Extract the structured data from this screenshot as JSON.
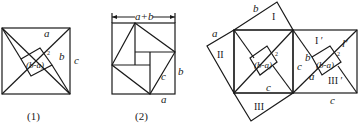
{
  "figure1": {
    "caption": "(1)",
    "labels": {
      "a": "a",
      "b": "b",
      "c": "c",
      "inner": "(b-a)",
      "inner_exp": "2"
    }
  },
  "figure2": {
    "caption": "(2)",
    "labels": {
      "top": "a+b",
      "b": "b",
      "c": "c",
      "a": "a"
    }
  },
  "figure3": {
    "labels": {
      "a_left": "a",
      "b_top": "b",
      "region_I": "I",
      "region_II": "II",
      "region_III": "III",
      "inner_left": "(b-a)",
      "inner_left_exp": "2",
      "c_bottom_center": "c",
      "c_mid": "c",
      "region_I_prime": "I ′",
      "l_prime": "l′",
      "region_III_prime": "III ′",
      "b_right": "b",
      "a_right": "a",
      "inner_right": "(b-a)",
      "inner_right_exp": "2",
      "c_bottom_right": "c"
    }
  },
  "colors": {
    "stroke": "#1a1a1a",
    "background": "#ffffff"
  }
}
